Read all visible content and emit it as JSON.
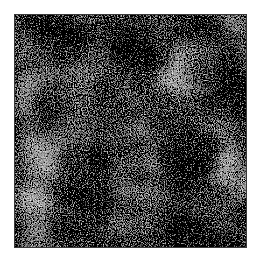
{
  "image": {
    "description": "grayscale speckle texture patch",
    "colors": {
      "frame_border": "#3a3a3a",
      "mean_gray": "#8a8a8a",
      "background": "#ffffff"
    }
  }
}
